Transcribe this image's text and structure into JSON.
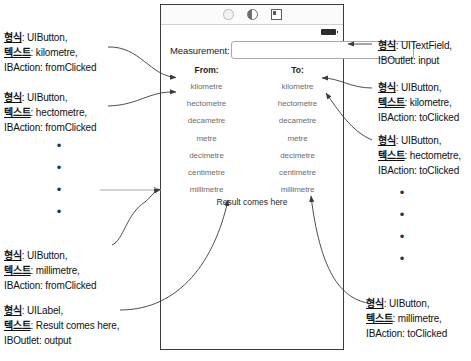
{
  "device": {
    "toolbar_icons": [
      "circle-icon",
      "half-circle-icon",
      "square-icon"
    ],
    "battery_icon": "battery-icon",
    "measurement_label": "Measurement:",
    "measurement_value": "",
    "measurement_placeholder": "",
    "from_header": "From:",
    "to_header": "To:",
    "units": [
      "kilometre",
      "hectometre",
      "decametre",
      "metre",
      "decimetre",
      "centimetre",
      "millimetre"
    ],
    "result_label": "Result comes here"
  },
  "annotations": {
    "left": [
      {
        "id": "from-kilometre",
        "line1_key": "형식",
        "line1_val": ": UIButton,",
        "line2_key": "텍스트",
        "line2_val": ": kilometre,",
        "line3": "IBAction: fromClicked"
      },
      {
        "id": "from-hectometre",
        "line1_key": "형식",
        "line1_val": ": UIButton,",
        "line2_key": "텍스트",
        "line2_val": ": hectometre,",
        "line3": "IBAction: fromClicked"
      },
      {
        "id": "from-millimetre",
        "line1_key": "형식",
        "line1_val": ": UIButton,",
        "line2_key": "텍스트",
        "line2_val": ": millimetre,",
        "line3": "IBAction: fromClicked"
      },
      {
        "id": "output-label",
        "line1_key": "형식",
        "line1_val": ": UILabel,",
        "line2_key": "텍스트",
        "line2_val": ": Result comes here,",
        "line3": "IBOutlet: output"
      }
    ],
    "right": [
      {
        "id": "input-textfield",
        "line1_key": "형식",
        "line1_val": ": UITextField,",
        "line2_key": "",
        "line2_val": "",
        "line3": "IBOutlet: input"
      },
      {
        "id": "to-kilometre",
        "line1_key": "형식",
        "line1_val": ": UIButton,",
        "line2_key": "텍스트",
        "line2_val": ": kilometre,",
        "line3": "IBAction: toClicked"
      },
      {
        "id": "to-hectometre",
        "line1_key": "형식",
        "line1_val": ": UIButton,",
        "line2_key": "텍스트",
        "line2_val": ": hectometre,",
        "line3": "IBAction: toClicked"
      },
      {
        "id": "to-millimetre",
        "line1_key": "형식",
        "line1_val": ": UIButton,",
        "line2_key": "텍스트",
        "line2_val": ": millimetre,",
        "line3": "IBAction: toClicked"
      }
    ],
    "ellipsis_dot": "•"
  },
  "colors": {
    "device_border": "#3b3b3b",
    "unit_text": "#6d6d6d",
    "annotation_text": "#111111",
    "leader_line": "#3a3a3a",
    "grey_arrow": "#aaaaaa"
  }
}
